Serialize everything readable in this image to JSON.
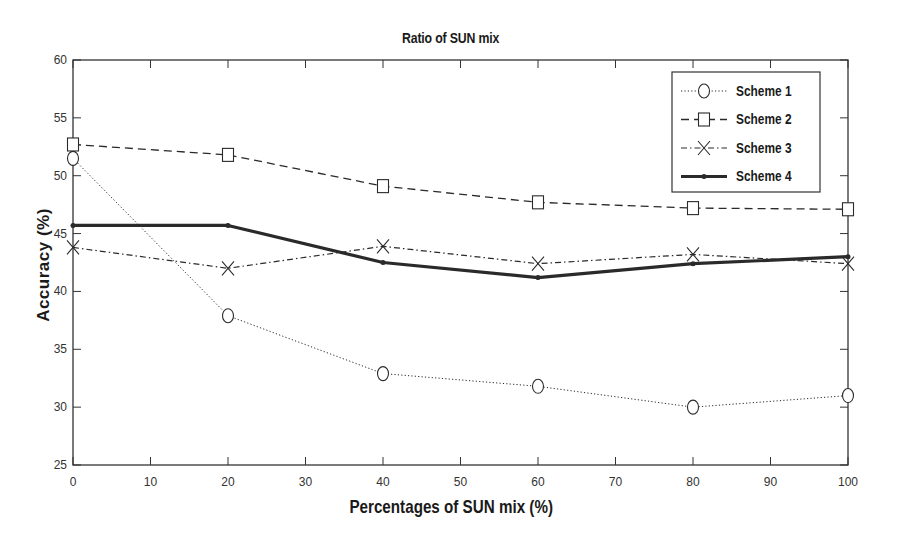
{
  "chart_data": {
    "type": "line",
    "title": "Ratio of SUN mix",
    "xlabel": "Percentages of SUN mix (%)",
    "ylabel": "Accuracy (%)",
    "x": [
      0,
      20,
      40,
      60,
      80,
      100
    ],
    "xlim": [
      0,
      100
    ],
    "ylim": [
      25,
      60
    ],
    "xticks": [
      0,
      10,
      20,
      30,
      40,
      50,
      60,
      70,
      80,
      90,
      100
    ],
    "yticks": [
      25,
      30,
      35,
      40,
      45,
      50,
      55,
      60
    ],
    "grid": false,
    "legend_position": "upper right",
    "series": [
      {
        "name": "Scheme 1",
        "line_style": "dotted",
        "marker": "circle",
        "values": [
          51.5,
          37.9,
          32.9,
          31.8,
          30.0,
          31.0
        ]
      },
      {
        "name": "Scheme 2",
        "line_style": "dashed",
        "marker": "square",
        "values": [
          52.7,
          51.8,
          49.1,
          47.7,
          47.2,
          47.1
        ]
      },
      {
        "name": "Scheme 3",
        "line_style": "dash-dot",
        "marker": "x",
        "values": [
          43.8,
          42.0,
          43.9,
          42.4,
          43.2,
          42.4
        ]
      },
      {
        "name": "Scheme 4",
        "line_style": "solid-thick",
        "marker": "dot",
        "values": [
          45.7,
          45.7,
          42.5,
          41.2,
          42.4,
          43.0
        ]
      }
    ]
  },
  "colors": {
    "axis": "#333333",
    "line": "#2a2a2a",
    "background": "#ffffff"
  }
}
